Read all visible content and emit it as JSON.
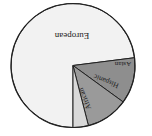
{
  "chart_data": {
    "type": "pie",
    "title": "",
    "orientation_note": "rendered rotated 180 degrees",
    "categories": [
      "European",
      "African",
      "Hispanic",
      "Asian"
    ],
    "values": [
      73,
      12,
      11,
      4
    ],
    "unit": "%",
    "colors": [
      "#f2f2f2",
      "#8e8e8e",
      "#9a9a9a",
      "#d9d9d9"
    ],
    "legend": "none (direct labels)"
  },
  "labels": {
    "european": "European",
    "african": "African",
    "hispanic": "Hispanic",
    "asian": "Asian"
  }
}
